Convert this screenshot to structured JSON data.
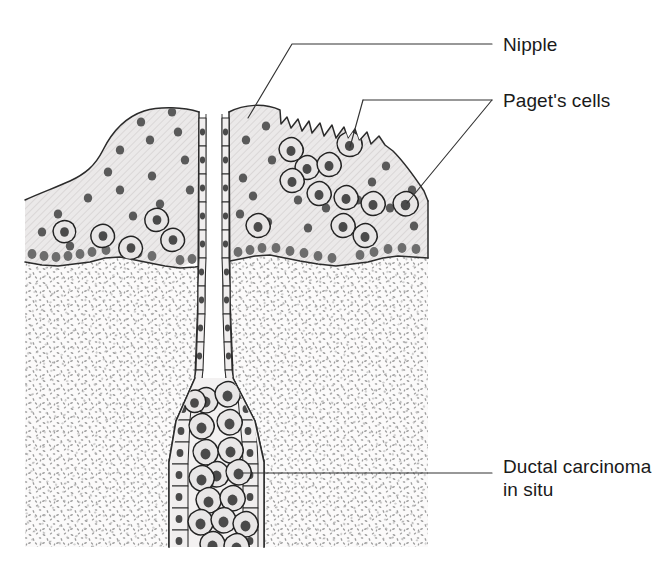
{
  "figure": {
    "width": 662,
    "height": 573,
    "background_color": "#ffffff"
  },
  "labels": [
    {
      "id": "nipple",
      "text": "Nipple",
      "x": 503,
      "y": 50,
      "leader_color": "#333333"
    },
    {
      "id": "pagets-cells",
      "text": "Paget's cells",
      "x": 503,
      "y": 106,
      "leader_color": "#333333"
    },
    {
      "id": "ductal-carcinoma-line1",
      "text": "Ductal carcinoma",
      "x": 503,
      "y": 472,
      "leader_color": "#333333"
    },
    {
      "id": "ductal-carcinoma-line2",
      "text": "in situ",
      "x": 503,
      "y": 495,
      "leader_color": "#333333"
    }
  ],
  "anatomy": {
    "epidermis": {
      "name": "epidermis",
      "fill_color": "#ebe9e9",
      "hatch_color": "#d3d0d0",
      "outline_color": "#2b2b2b"
    },
    "dermis": {
      "name": "dermis",
      "fill_color": "#fbfafa",
      "stipple_color": "#9a9a9a",
      "outline_color": "#2b2b2b"
    },
    "lactiferous_duct": {
      "name": "lactiferous-duct",
      "lumen_color": "#ffffff",
      "wall_cell_fill": "#f0eeee",
      "wall_cell_stroke": "#2a2a2a"
    },
    "pagets_cell": {
      "name": "pagets-cell",
      "cytoplasm_color": "#e8e6e6",
      "nucleus_color": "#3d3d3d",
      "membrane_color": "#232323"
    },
    "keratinocyte": {
      "name": "keratinocyte-dot",
      "color": "#5a5a5a"
    },
    "basal_layer": {
      "name": "basal-cell-layer",
      "color": "#6d6d6d"
    },
    "erosion": {
      "name": "nipple-erosion",
      "description": "jagged ulcerated surface"
    }
  },
  "geometry": {
    "epidermis_outline": "M 25,200 C 40,192 58,186 72,180 C 86,174 96,166 104,150 C 114,130 126,118 144,112 C 162,106 186,107 200,112 L 200,116 L 218,116 L 228,110 C 246,104 266,104 281,110 L 281,124 L 288,118 L 292,128 L 299,120 L 303,131 L 310,122 L 313,133 L 321,124 L 325,136 L 333,126 L 337,138 L 345,128 L 349,139 L 356,130 L 360,141 L 368,133 L 372,144 L 380,137 L 386,145 L 394,152 C 404,162 414,175 424,190 L 428,200 L 428,258 L 398,256 L 368,262 L 336,266 L 300,261 L 270,256 L 240,259 L 210,265 L 180,268 L 150,264 L 120,258 L 90,262 L 58,266 L 25,262 Z",
    "dermis_outline": "M 25,262 L 58,266 L 90,262 L 120,258 L 150,264 L 180,268 L 210,265 L 240,259 L 270,256 L 300,261 L 336,266 L 368,262 L 398,256 L 428,258 L 428,547 L 25,547 Z",
    "duct_left_wall": "M 200,112 L 199,300 L 196,380 L 178,420 L 172,460 L 172,547",
    "duct_right_wall": "M 228,112 L 229,300 L 232,380 L 254,420 L 262,460 L 262,547",
    "duct_bottom_y": 547
  },
  "counts": {
    "pagets_cells_in_epidermis": 18,
    "keratinocyte_dots": 70,
    "duct_carcinoma_cells": 22
  }
}
